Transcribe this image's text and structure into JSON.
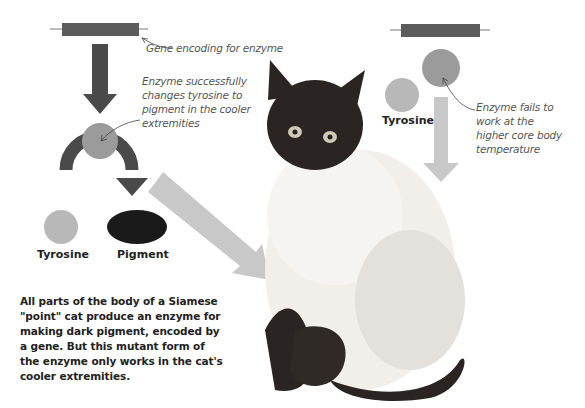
{
  "diagram": {
    "left_pathway": {
      "gene_label": "Gene encoding for enzyme",
      "enzyme_note": "Enzyme successfully changes tyrosine to pigment in the cooler extremities",
      "enzyme_note_lines": [
        "Enzyme successfully",
        "changes tyrosine to",
        "pigment in the cooler",
        "extremities"
      ],
      "tyrosine_label": "Tyrosine",
      "pigment_label": "Pigment"
    },
    "right_pathway": {
      "tyrosine_label": "Tyrosine",
      "enzyme_note": "Enzyme fails to work at the higher core body temperature",
      "enzyme_note_lines": [
        "Enzyme fails to",
        "work at the",
        "higher core body",
        "temperature"
      ]
    },
    "description_lines": [
      "All parts of the body of a Siamese",
      "\"point\" cat produce an enzyme for",
      "making dark pigment, encoded by",
      "a gene. But this mutant form of",
      "the enzyme only works in the cat's",
      "cooler extremities."
    ],
    "colors": {
      "gene_bar": "#5c5c5c",
      "dark_arrow": "#4a4a4a",
      "enzyme_circle": "#9b9b9b",
      "tyrosine_circle": "#b8b8b8",
      "pigment": "#1a1a1a",
      "light_arrow": "#c8c8c8"
    }
  }
}
